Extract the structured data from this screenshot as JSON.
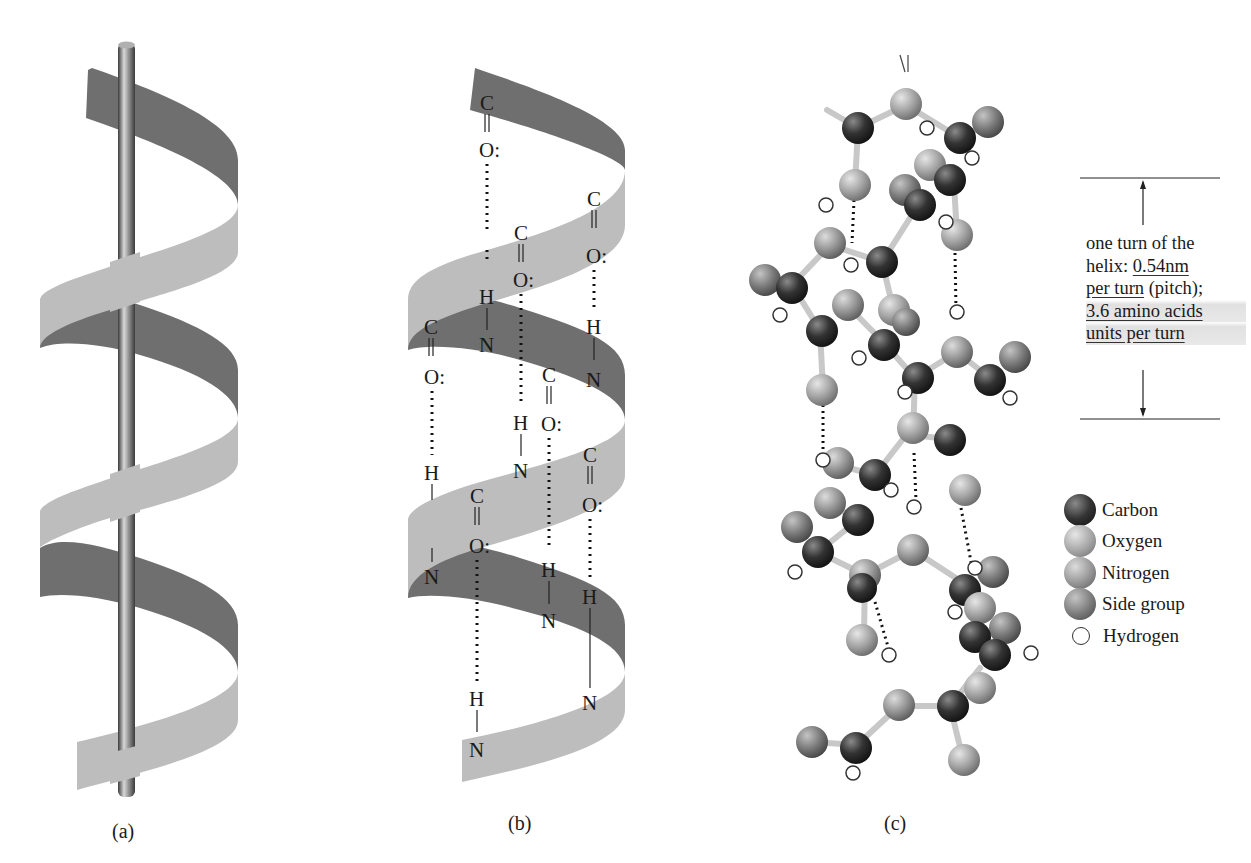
{
  "figure": {
    "panels": [
      {
        "id": "a",
        "caption": "(a)",
        "description": "Ribbon alpha helix wound around central rod"
      },
      {
        "id": "b",
        "caption": "(b)",
        "description": "Ribbon alpha helix with C=O···H–N hydrogen bonds"
      },
      {
        "id": "c",
        "caption": "(c)",
        "description": "Ball-and-stick model of alpha helix"
      }
    ],
    "atom_labels": {
      "carbon": "C",
      "oxygen": "O:",
      "hydrogen": "H",
      "nitrogen": "N"
    },
    "pitch_annotation": {
      "line1": "one turn of the",
      "line2_prefix": "helix: ",
      "line2_underlined": "0.54nm",
      "line3_underlined": "per turn",
      "line3_suffix": " (pitch);",
      "line4_underlined": "3.6 amino acids",
      "line5_underlined": "units per turn"
    },
    "legend": [
      {
        "label": "Carbon",
        "color": "#2e2e2e"
      },
      {
        "label": "Oxygen",
        "color": "#9a9a9a"
      },
      {
        "label": "Nitrogen",
        "color": "#8a8a8a"
      },
      {
        "label": "Side group",
        "color": "#6e6e6e"
      },
      {
        "label": "Hydrogen",
        "color": "#ffffff"
      }
    ],
    "colors": {
      "ribbon_dark": "#6f6f6f",
      "ribbon_light": "#bdbdbd",
      "rod": "#8a8a8a"
    }
  }
}
